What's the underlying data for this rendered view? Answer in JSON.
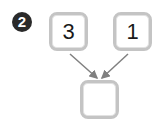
{
  "problem": {
    "number": "2",
    "inputs": [
      {
        "value": "3"
      },
      {
        "value": "1"
      }
    ],
    "answer_box": {
      "value": ""
    }
  },
  "colors": {
    "badge": "#2a2a2a",
    "box_border": "#c4c4c4",
    "arrow": "#808080"
  }
}
